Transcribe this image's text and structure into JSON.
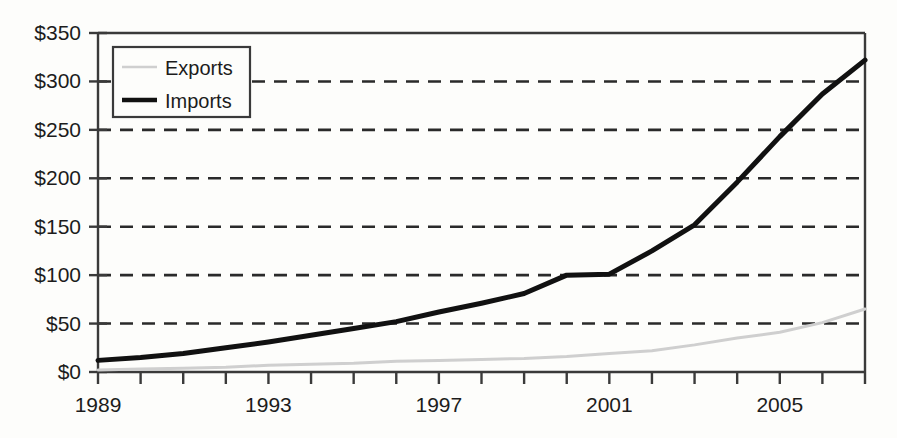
{
  "chart_data": {
    "type": "line",
    "title": "",
    "xlabel": "",
    "ylabel": "",
    "xlim": [
      1989,
      2007
    ],
    "ylim": [
      0,
      350
    ],
    "grid": true,
    "grid_style": "dashed-horizontal",
    "legend_position": "top-left",
    "y_ticks": [
      0,
      50,
      100,
      150,
      200,
      250,
      300,
      350
    ],
    "y_tick_labels": [
      "$0",
      "$50",
      "$100",
      "$150",
      "$200",
      "$250",
      "$300",
      "$350"
    ],
    "x_ticks": [
      1989,
      1990,
      1991,
      1992,
      1993,
      1994,
      1995,
      1996,
      1997,
      1998,
      1999,
      2000,
      2001,
      2002,
      2003,
      2004,
      2005,
      2006,
      2007
    ],
    "x_tick_labels": [
      "1989",
      "",
      "",
      "",
      "1993",
      "",
      "",
      "",
      "1997",
      "",
      "",
      "",
      "2001",
      "",
      "",
      "",
      "2005",
      "",
      ""
    ],
    "x": [
      1989,
      1990,
      1991,
      1992,
      1993,
      1994,
      1995,
      1996,
      1997,
      1998,
      1999,
      2000,
      2001,
      2002,
      2003,
      2004,
      2005,
      2006,
      2007
    ],
    "series": [
      {
        "name": "Exports",
        "color": "#cfcfcf",
        "width": 3,
        "values": [
          2,
          3,
          4,
          5,
          7,
          8,
          9,
          11,
          12,
          13,
          14,
          16,
          19,
          22,
          28,
          35,
          41,
          51,
          65
        ]
      },
      {
        "name": "Imports",
        "color": "#111111",
        "width": 5,
        "values": [
          12,
          15,
          19,
          25,
          31,
          38,
          45,
          52,
          62,
          71,
          81,
          100,
          101,
          125,
          152,
          196,
          243,
          287,
          322
        ]
      }
    ]
  },
  "legend": {
    "items": [
      {
        "label": "Exports",
        "swatch_color": "#cfcfcf"
      },
      {
        "label": "Imports",
        "swatch_color": "#111111"
      }
    ]
  },
  "axis": {
    "frame_color": "#3a3a3a",
    "grid_color": "#2a2a2a"
  }
}
